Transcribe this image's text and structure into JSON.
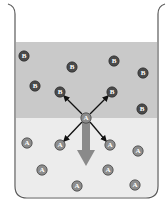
{
  "diagram": {
    "type": "beaker-diffusion",
    "colors": {
      "upper_layer": "#c9c9c9",
      "lower_layer": "#ececec",
      "beaker_outline": "#5a5a5a",
      "particle_b": "#4a4a4a",
      "particle_a": "#8d8d8d",
      "arrow": "#8a8a8a",
      "small_arrows": "#111111"
    },
    "layers": [
      {
        "name": "upper",
        "particle": "B"
      },
      {
        "name": "lower",
        "particle": "A"
      }
    ],
    "particles_b": [
      {
        "label": "B",
        "x": 24,
        "y": 56
      },
      {
        "label": "B",
        "x": 72,
        "y": 67
      },
      {
        "label": "B",
        "x": 114,
        "y": 61
      },
      {
        "label": "B",
        "x": 143,
        "y": 73
      },
      {
        "label": "B",
        "x": 35,
        "y": 86
      },
      {
        "label": "B",
        "x": 60,
        "y": 92
      },
      {
        "label": "B",
        "x": 112,
        "y": 92
      },
      {
        "label": "B",
        "x": 142,
        "y": 109
      }
    ],
    "central_particle": {
      "label": "A",
      "x": 86,
      "y": 118
    },
    "particles_a": [
      {
        "label": "A",
        "x": 27,
        "y": 143
      },
      {
        "label": "A",
        "x": 60,
        "y": 145
      },
      {
        "label": "A",
        "x": 110,
        "y": 145
      },
      {
        "label": "A",
        "x": 138,
        "y": 151
      },
      {
        "label": "A",
        "x": 42,
        "y": 170
      },
      {
        "label": "A",
        "x": 108,
        "y": 170
      },
      {
        "label": "A",
        "x": 77,
        "y": 186
      },
      {
        "label": "A",
        "x": 135,
        "y": 185
      }
    ],
    "interaction_arrows": [
      {
        "to": "upper-left B"
      },
      {
        "to": "upper-right B"
      },
      {
        "to": "lower-left A"
      },
      {
        "to": "lower-right A"
      }
    ],
    "net_motion_arrow": {
      "direction": "down"
    }
  }
}
